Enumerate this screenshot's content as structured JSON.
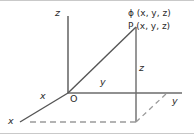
{
  "figure": {
    "colors": {
      "axis": "#6b6b6b",
      "solid_line": "#555555",
      "dashed_line": "#9a9a9a",
      "text": "#2b2b2b",
      "background": "#ffffff",
      "border": "#c9c9c9"
    },
    "labels": {
      "z_axis": "z",
      "y_axis": "y",
      "x_axis": "x",
      "origin": "O",
      "y_segment": "y",
      "x_segment": "x",
      "z_segment": "z",
      "phi_point": "ϕ (x, y, z)",
      "p_point": "P (x, y, z)"
    },
    "geometry": {
      "origin": [
        68,
        93
      ],
      "z_axis_top": [
        68,
        16
      ],
      "y_axis_right": [
        182,
        93
      ],
      "x_axis_end": [
        20,
        122
      ],
      "point_p": [
        136,
        27
      ],
      "point_foot": [
        136,
        122
      ],
      "point_axis_cross": [
        136,
        93
      ],
      "dash_corner": [
        167,
        93
      ]
    }
  }
}
